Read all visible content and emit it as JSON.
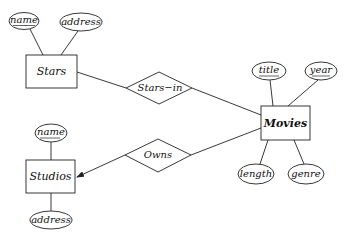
{
  "diagram": {
    "type": "entity-relationship",
    "entities": [
      {
        "id": "stars",
        "label": "Stars"
      },
      {
        "id": "movies",
        "label": "Movies"
      },
      {
        "id": "studios",
        "label": "Studios"
      }
    ],
    "relationships": [
      {
        "id": "stars_in",
        "label": "Stars−in",
        "connects": [
          "Stars",
          "Movies"
        ]
      },
      {
        "id": "owns",
        "label": "Owns",
        "connects": [
          "Movies",
          "Studios"
        ],
        "arrow_to": "Studios"
      }
    ],
    "attributes": {
      "stars": [
        {
          "label": "name",
          "key": true
        },
        {
          "label": "address",
          "key": false
        }
      ],
      "movies": [
        {
          "label": "title",
          "key": true
        },
        {
          "label": "year",
          "key": true
        },
        {
          "label": "length",
          "key": false
        },
        {
          "label": "genre",
          "key": false
        }
      ],
      "studios": [
        {
          "label": "name",
          "key": true
        },
        {
          "label": "address",
          "key": false
        }
      ]
    }
  }
}
